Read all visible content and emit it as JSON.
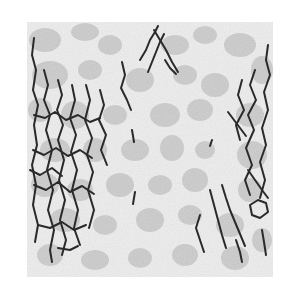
{
  "image": {
    "subject": "crack-pattern-microstructure",
    "width": 297,
    "height": 290,
    "panel": {
      "x": 27,
      "y": 22,
      "w": 246,
      "h": 255
    },
    "colors": {
      "background": "#ffffff",
      "matrix": "#eeeeee",
      "grain": "#cfcfcf",
      "grain_dark": "#c2c2c2",
      "crack": "#2a2a2a"
    }
  }
}
